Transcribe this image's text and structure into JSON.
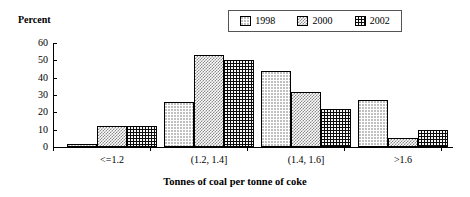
{
  "chart_data": {
    "type": "bar",
    "title": "",
    "xlabel": "Tonnes of coal per tonne of coke",
    "ylabel": "Percent",
    "categories": [
      "<=1.2",
      "(1.2, 1.4]",
      "(1.4, 1.6]",
      ">1.6"
    ],
    "series": [
      {
        "name": "1998",
        "values": [
          2,
          26,
          44,
          27
        ],
        "pattern": "white-dotted",
        "color": "#ffffff"
      },
      {
        "name": "2000",
        "values": [
          12,
          53,
          32,
          5
        ],
        "pattern": "gray-checker",
        "color": "#8a8a8a"
      },
      {
        "name": "2002",
        "values": [
          12,
          50,
          22,
          10
        ],
        "pattern": "black-dotted",
        "color": "#0d0d0d"
      }
    ],
    "ylim": [
      0,
      60
    ],
    "yticks": [
      0,
      10,
      20,
      30,
      40,
      50,
      60
    ],
    "ytick_labels": [
      "0",
      "10",
      "20",
      "30",
      "40",
      "50",
      "60"
    ],
    "grid": false,
    "legend_position": "top-right"
  },
  "legend": {
    "entries": [
      {
        "label": "1998"
      },
      {
        "label": "2000"
      },
      {
        "label": "2002"
      }
    ]
  }
}
